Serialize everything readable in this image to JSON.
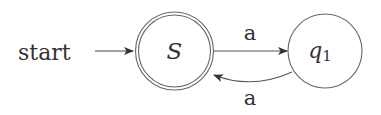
{
  "diagram": {
    "type": "finite-automaton",
    "start_label": "start",
    "states": [
      {
        "id": "S",
        "label": "S",
        "accepting": true,
        "initial": true
      },
      {
        "id": "q1",
        "label": "q",
        "subscript": "1",
        "accepting": false,
        "initial": false
      }
    ],
    "transitions": [
      {
        "from": "S",
        "to": "q1",
        "label": "a"
      },
      {
        "from": "q1",
        "to": "S",
        "label": "a"
      }
    ],
    "colors": {
      "stroke": "#555555",
      "text": "#333333",
      "background": "#ffffff"
    }
  }
}
